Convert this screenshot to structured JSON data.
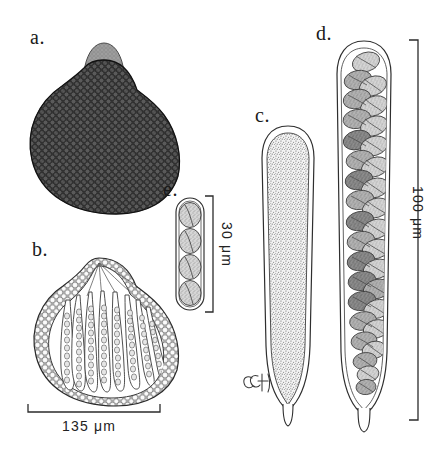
{
  "figure": {
    "type": "scientific-illustration-plate",
    "background_color": "#ffffff",
    "ink_color": "#2b2b2b"
  },
  "panels": [
    {
      "id": "a",
      "label": "a.",
      "label_x": 30,
      "label_y": 26,
      "description": "whole perithecium / cleistothecium with papillate ostiolar neck, dense dark cellular surface texture",
      "fill_tone": "#3a3a3a"
    },
    {
      "id": "b",
      "label": "b.",
      "label_x": 32,
      "label_y": 238,
      "description": "vertical section of fruiting body showing thick cellular peridium and a hymenium of elongate asci",
      "fill_tone": "#ffffff",
      "asci_count": 10
    },
    {
      "id": "c",
      "label": "c.",
      "label_x": 255,
      "label_y": 104,
      "description": "immature ascus, clavate, stipitate, with finely granular contents",
      "fill_tone": "#e8e8e8"
    },
    {
      "id": "d",
      "label": "d.",
      "label_x": 316,
      "label_y": 22,
      "description": "mature ascus packed with biseriate ellipsoidal ascospores",
      "fill_tone": "#bdbdbd",
      "spore_count": 32
    },
    {
      "id": "e",
      "label": "e.",
      "label_x": 163,
      "label_y": 178,
      "description": "four ascospores in chain, each with a longitudinal germ slit",
      "fill_tone": "#c9c9c9",
      "spore_count": 4
    }
  ],
  "scale_bars": [
    {
      "id": "scale-135",
      "text": "135 μm",
      "orientation": "horizontal",
      "value": 135,
      "unit": "μm",
      "belongs_to": "b",
      "x1": 28,
      "x2": 160,
      "y": 412,
      "label_x": 62,
      "label_y": 422
    },
    {
      "id": "scale-30",
      "text": "30 μm",
      "orientation": "vertical",
      "value": 30,
      "unit": "μm",
      "belongs_to": "e",
      "x": 212,
      "y1": 196,
      "y2": 312,
      "label_x": 235,
      "label_y": 222
    },
    {
      "id": "scale-100",
      "text": "100 μm",
      "orientation": "vertical",
      "value": 100,
      "unit": "μm",
      "belongs_to": "d",
      "x": 418,
      "y1": 40,
      "y2": 420,
      "label_x": 425,
      "label_y": 186
    }
  ],
  "signature": {
    "text": "CGH",
    "x": 247,
    "y": 382,
    "description": "artist monogram in cursive script"
  }
}
